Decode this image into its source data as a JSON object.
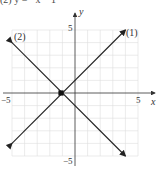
{
  "header": {
    "cut_text": "(2) y = −x − 1"
  },
  "axes": {
    "x_label": "x",
    "y_label": "y",
    "x_tick_neg": "−5",
    "x_tick_pos": "5",
    "y_tick_pos": "5",
    "y_tick_neg": "−5"
  },
  "lines": [
    {
      "label": "(1)",
      "equation": "y = x + 1"
    },
    {
      "label": "(2)",
      "equation": "y = −x − 1"
    }
  ],
  "colors": {
    "line": "#222222",
    "grid": "#dddddd",
    "axis": "#333333"
  },
  "chart_data": {
    "type": "line",
    "title": "",
    "xlabel": "x",
    "ylabel": "y",
    "xlim": [
      -5,
      5
    ],
    "ylim": [
      -5,
      5
    ],
    "grid": true,
    "x_ticks": [
      -5,
      5
    ],
    "y_ticks": [
      -5,
      5
    ],
    "series": [
      {
        "name": "(1)",
        "equation": "y = x + 1",
        "x": [
          -5,
          4
        ],
        "y": [
          -4,
          5
        ]
      },
      {
        "name": "(2)",
        "equation": "y = -x - 1",
        "x": [
          -5,
          4
        ],
        "y": [
          4,
          -5
        ]
      }
    ],
    "annotations": [
      {
        "text": "(1)",
        "at": [
          4.3,
          5
        ]
      },
      {
        "text": "(2)",
        "at": [
          -4.5,
          4.2
        ]
      },
      {
        "type": "point",
        "at": [
          -1,
          0
        ],
        "label": "intersection"
      }
    ]
  }
}
